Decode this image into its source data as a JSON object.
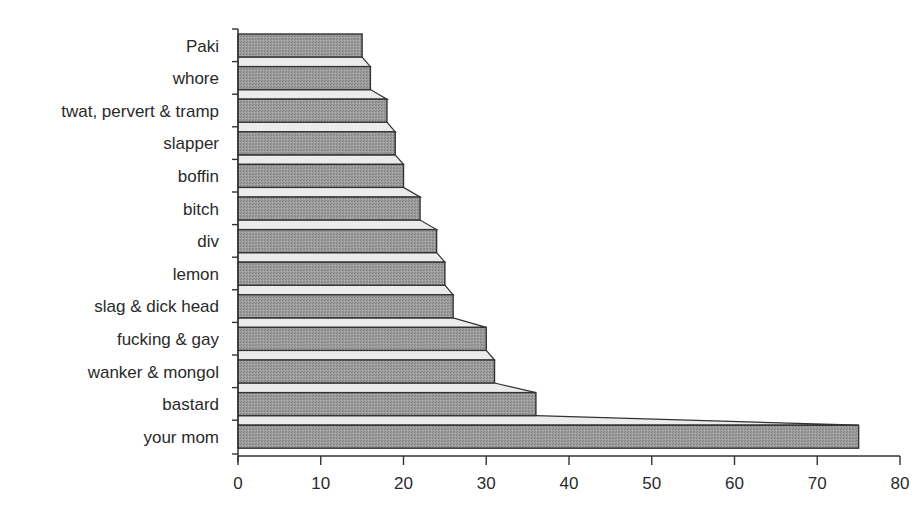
{
  "chart_data": {
    "type": "bar",
    "orientation": "horizontal",
    "title": "",
    "xlabel": "",
    "ylabel": "",
    "categories": [
      "Paki",
      "whore",
      "twat, pervert & tramp",
      "slapper",
      "boffin",
      "bitch",
      "div",
      "lemon",
      "slag & dick head",
      "fucking & gay",
      "wanker & mongol",
      "bastard",
      "your mom"
    ],
    "values": [
      15,
      16,
      18,
      19,
      20,
      22,
      24,
      25,
      26,
      30,
      31,
      36,
      75
    ],
    "xlim": [
      0,
      80
    ],
    "xticks": [
      0,
      10,
      20,
      30,
      40,
      50,
      60,
      70,
      80
    ],
    "grid": false,
    "legend": null,
    "style": "3d-stepped"
  },
  "colors": {
    "bar_fill": "#9c9c9c",
    "bar_top_face": "#ebebeb",
    "outline": "#333333",
    "axis": "#333333",
    "text": "#2a2a2a"
  }
}
